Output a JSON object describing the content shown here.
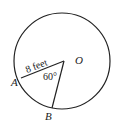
{
  "diagram": {
    "type": "circle-sector",
    "center_label": "O",
    "point_a_label": "A",
    "point_b_label": "B",
    "radius_label": "8 feet",
    "angle_label": "60°",
    "colors": {
      "stroke": "#222222",
      "background": "#ffffff"
    }
  }
}
